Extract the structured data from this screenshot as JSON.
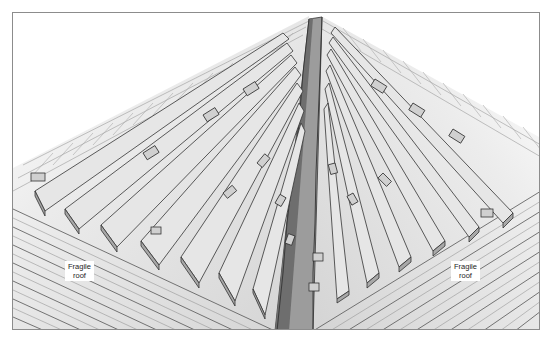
{
  "diagram": {
    "labels": {
      "left": {
        "line1": "Fragile",
        "line2": "roof"
      },
      "right": {
        "line1": "Fragile",
        "line2": "roof"
      }
    },
    "colors": {
      "frame": "#8c8c8c",
      "roof_fill": "#d6d6d6",
      "board_fill": "#e4e4e4",
      "board_edge": "#9a9a9a",
      "gutter_light": "#9c9c9c",
      "gutter_dark": "#6e6e6e",
      "line": "#3a3a3a"
    },
    "elements": [
      "left-roof-slope",
      "right-roof-slope",
      "valley-gutter",
      "crawling-boards-left",
      "crawling-boards-right"
    ]
  }
}
